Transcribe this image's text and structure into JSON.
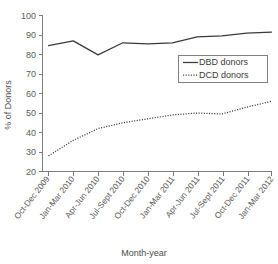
{
  "chart_data": {
    "type": "line",
    "title": "",
    "xlabel": "Month-year",
    "ylabel": "% of Donors",
    "ylim": [
      20,
      100
    ],
    "y_ticks": [
      20,
      30,
      40,
      50,
      60,
      70,
      80,
      90,
      100
    ],
    "grid": false,
    "legend_position": "center-right",
    "categories": [
      "Oct-Dec 2009",
      "Jan-Mar 2010",
      "Apr-Jun 2010",
      "Jul-Sept 2010",
      "Oct-Dec 2010",
      "Jan-Mar 2011",
      "Apr-Jun 2011",
      "Jul-Sept 2011",
      "Oct-Dec 2011",
      "Jan-Mar 2012"
    ],
    "series": [
      {
        "name": "DBD donors",
        "style": "solid",
        "color": "#3a3a3a",
        "values": [
          84.5,
          87.0,
          79.8,
          86.0,
          85.5,
          86.0,
          89.0,
          89.5,
          91.0,
          91.5
        ]
      },
      {
        "name": "DCD donors",
        "style": "dotted",
        "color": "#3a3a3a",
        "values": [
          28.0,
          36.0,
          42.0,
          45.0,
          47.0,
          49.0,
          50.0,
          49.5,
          53.0,
          56.0
        ]
      }
    ]
  },
  "legend": {
    "entries": [
      {
        "label": "DBD donors",
        "style": "solid"
      },
      {
        "label": "DCD donors",
        "style": "dotted"
      }
    ]
  }
}
